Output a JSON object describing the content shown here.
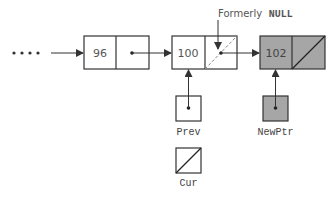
{
  "diagram": {
    "leading_dots": "....",
    "nodes": [
      {
        "id": "node-96",
        "value": "96",
        "fill": "#ffffff",
        "next": "pointer"
      },
      {
        "id": "node-100",
        "value": "100",
        "fill": "#ffffff",
        "next": "pointer (formerly NULL)"
      },
      {
        "id": "node-102",
        "value": "102",
        "fill": "#a6a6a6",
        "next": "NULL"
      }
    ],
    "annotation": {
      "label_prefix": "Formerly",
      "label_code": "NULL"
    },
    "pointers": [
      {
        "name": "Prev",
        "points_to": "node-100",
        "fill": "#ffffff"
      },
      {
        "name": "NewPtr",
        "points_to": "node-102",
        "fill": "#a6a6a6"
      },
      {
        "name": "Cur",
        "points_to": "NULL",
        "fill": "#ffffff"
      }
    ],
    "colors": {
      "stroke": "#333333",
      "text": "#555555",
      "shaded": "#a6a6a6"
    }
  }
}
